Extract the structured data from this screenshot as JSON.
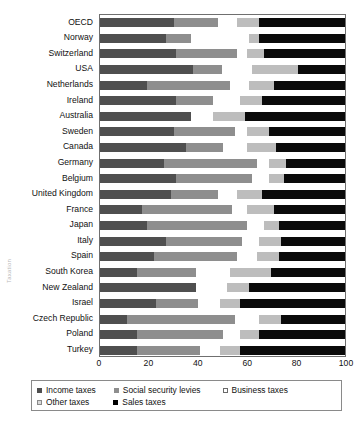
{
  "chart_data": {
    "type": "bar",
    "orientation": "horizontal",
    "stacked": true,
    "title": "",
    "xlabel": "",
    "ylabel": "Taxation",
    "xlim": [
      0,
      100
    ],
    "xticks": [
      0,
      20,
      40,
      60,
      80,
      100
    ],
    "grid": false,
    "legend_position": "bottom",
    "categories": [
      "OECD",
      "Norway",
      "Switzerland",
      "USA",
      "Netherlands",
      "Ireland",
      "Australia",
      "Sweden",
      "Canada",
      "Germany",
      "Belgium",
      "United Kingdom",
      "France",
      "Japan",
      "Italy",
      "Spain",
      "South Korea",
      "New Zealand",
      "Israel",
      "Czech Republic",
      "Poland",
      "Turkey"
    ],
    "series": [
      {
        "name": "Income taxes",
        "color": "#4f4f4f",
        "values": [
          30,
          27,
          31,
          38,
          19,
          31,
          37,
          30,
          35,
          26,
          31,
          29,
          17,
          19,
          27,
          22,
          15,
          39,
          23,
          11,
          15,
          15
        ]
      },
      {
        "name": "Social security levies",
        "color": "#8e8e8e",
        "values": [
          18,
          10,
          25,
          12,
          34,
          15,
          0,
          25,
          15,
          38,
          31,
          19,
          37,
          41,
          31,
          34,
          24,
          0,
          17,
          44,
          35,
          26
        ]
      },
      {
        "name": "Business taxes",
        "color": "#ffffff",
        "values": [
          8,
          24,
          4,
          12,
          8,
          11,
          9,
          5,
          10,
          5,
          7,
          8,
          6,
          7,
          7,
          8,
          14,
          13,
          9,
          10,
          7,
          8
        ]
      },
      {
        "name": "Other taxes",
        "color": "#bdbdbd",
        "values": [
          9,
          4,
          7,
          19,
          10,
          9,
          13,
          9,
          12,
          7,
          6,
          10,
          11,
          6,
          9,
          9,
          17,
          9,
          8,
          9,
          8,
          8
        ]
      },
      {
        "name": "Sales taxes",
        "color": "#0a0a0a",
        "values": [
          35,
          35,
          33,
          19,
          29,
          34,
          41,
          31,
          28,
          24,
          25,
          34,
          29,
          27,
          26,
          27,
          30,
          39,
          43,
          26,
          35,
          43
        ]
      }
    ]
  },
  "legend": {
    "items": [
      {
        "label": "Income taxes",
        "swatch": "s0"
      },
      {
        "label": "Social security levies",
        "swatch": "s1"
      },
      {
        "label": "Business taxes",
        "swatch": "s2"
      },
      {
        "label": "Other taxes",
        "swatch": "s3"
      },
      {
        "label": "Sales taxes",
        "swatch": "s4"
      }
    ]
  }
}
